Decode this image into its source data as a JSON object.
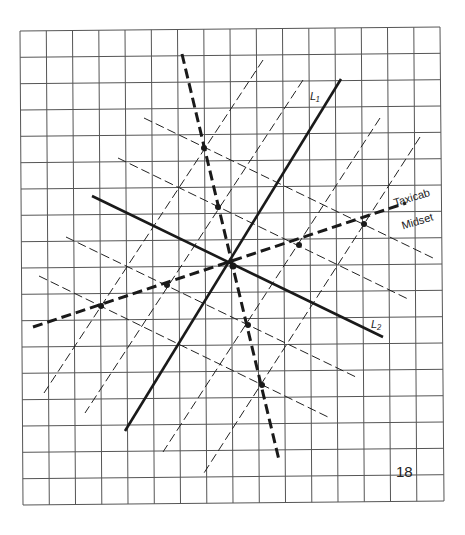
{
  "figure": {
    "page_number": "18",
    "labels": {
      "line1": "L₁",
      "line2": "L₂",
      "taxicab": "Taxicab",
      "midset": "Midset"
    },
    "grid": {
      "columns": 16,
      "rows": 18,
      "color": "#444444"
    },
    "colors": {
      "ink": "#1a1a1a",
      "grid": "#555555",
      "background": "#ffffff"
    }
  }
}
